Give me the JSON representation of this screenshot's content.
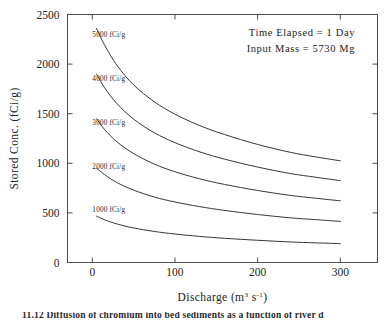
{
  "chart_data": {
    "type": "line",
    "title": "",
    "xlabel": "Discharge (m3 s-1)",
    "xlabel_parts": {
      "base": "Discharge (m",
      "exp1": "3",
      "mid": " s",
      "exp2": "-1",
      "tail": ")"
    },
    "ylabel": "Stored Conc. (fCi/g)",
    "xlim": [
      -30,
      345
    ],
    "ylim": [
      0,
      2500
    ],
    "xticks": [
      0,
      100,
      200,
      300
    ],
    "yticks": [
      0,
      500,
      1000,
      1500,
      2000,
      2500
    ],
    "xtick_labels": [
      "0",
      "100",
      "200",
      "300"
    ],
    "ytick_labels": [
      "0",
      "500",
      "1000",
      "1500",
      "2000",
      "2500"
    ],
    "grid": false,
    "legend": "inline-curve-labels",
    "annotations": [
      "Time Elapsed  =  1 Day",
      "Input Mass  =  5730 Mg"
    ],
    "series": [
      {
        "name": "5000 fCi/g",
        "label": "5000 fCi/g",
        "label_x": 20,
        "label_y": 2300,
        "x": [
          5,
          15,
          30,
          50,
          75,
          100,
          130,
          160,
          200,
          240,
          270,
          300
        ],
        "values": [
          2360,
          2190,
          1985,
          1790,
          1620,
          1495,
          1380,
          1290,
          1190,
          1110,
          1065,
          1025
        ]
      },
      {
        "name": "4000 fCi/g",
        "label": "4000 fCi/g",
        "label_x": 20,
        "label_y": 1855,
        "x": [
          5,
          15,
          30,
          50,
          75,
          100,
          130,
          160,
          200,
          240,
          270,
          300
        ],
        "values": [
          1900,
          1760,
          1600,
          1445,
          1308,
          1208,
          1115,
          1042,
          962,
          896,
          860,
          825
        ]
      },
      {
        "name": "3000 fCi/g",
        "label": "3000 fCi/g",
        "label_x": 20,
        "label_y": 1420,
        "x": [
          5,
          15,
          30,
          50,
          75,
          100,
          130,
          160,
          200,
          240,
          270,
          300
        ],
        "values": [
          1450,
          1340,
          1215,
          1098,
          992,
          915,
          843,
          787,
          726,
          676,
          648,
          622
        ]
      },
      {
        "name": "2000 fCi/g",
        "label": "2000 fCi/g",
        "label_x": 20,
        "label_y": 975,
        "x": [
          5,
          15,
          30,
          50,
          75,
          100,
          130,
          160,
          200,
          240,
          270,
          300
        ],
        "values": [
          952,
          885,
          805,
          730,
          660,
          610,
          563,
          525,
          484,
          450,
          432,
          414
        ]
      },
      {
        "name": "1000 fCi/g",
        "label": "1000 fCi/g",
        "label_x": 20,
        "label_y": 535,
        "x": [
          5,
          15,
          30,
          50,
          75,
          100,
          130,
          160,
          200,
          240,
          270,
          300
        ],
        "values": [
          468,
          430,
          388,
          348,
          313,
          287,
          263,
          244,
          224,
          207,
          198,
          190
        ]
      }
    ],
    "colors": {
      "line": "#2b2b2b",
      "axis": "#3a3a3a",
      "text": "#222222",
      "background": "#ffffff"
    }
  },
  "caption": {
    "text": "11.12  Diffusion of chromium into bed sediments as a function of river d"
  }
}
